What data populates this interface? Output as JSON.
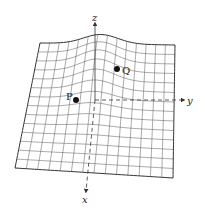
{
  "figure": {
    "axes": {
      "z_label": "z",
      "y_label": "y",
      "x_label": "x"
    },
    "points": [
      {
        "label": "P",
        "x": 76,
        "y": 100
      },
      {
        "label": "Q",
        "x": 117,
        "y": 69
      }
    ],
    "colors": {
      "grid": "#555555",
      "outline": "#333333",
      "axis": "#333333",
      "point": "#111111"
    },
    "grid": {
      "rows": 14,
      "cols": 14
    }
  }
}
